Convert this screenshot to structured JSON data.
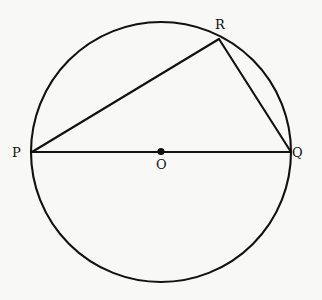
{
  "figure": {
    "background_color": "#f8f8f6",
    "stroke_color": "#111111",
    "width": 322,
    "height": 300
  },
  "circle": {
    "name": "circle-outline",
    "center_x": 161,
    "center_y": 152,
    "radius": 130,
    "stroke_width": 2.1,
    "fill": "none"
  },
  "center_point": {
    "name": "center-dot",
    "x": 161,
    "y": 151.5,
    "radius": 3.6,
    "fill": "#111111"
  },
  "points": [
    {
      "id": "P",
      "label": "P",
      "x": 32,
      "y": 152,
      "label_x": 12,
      "label_y": 146
    },
    {
      "id": "Q",
      "label": "Q",
      "x": 291,
      "y": 152,
      "label_x": 292,
      "label_y": 146
    },
    {
      "id": "R",
      "label": "R",
      "x": 219,
      "y": 39,
      "label_x": 215,
      "label_y": 18
    },
    {
      "id": "O",
      "label": "O",
      "x": 161,
      "y": 152,
      "label_x": 156,
      "label_y": 158
    }
  ],
  "segments": [
    {
      "name": "segment-PQ",
      "from": "P",
      "to": "Q",
      "x1": 32,
      "y1": 152,
      "x2": 291,
      "y2": 152,
      "stroke_width": 2.1
    },
    {
      "name": "segment-PR",
      "from": "P",
      "to": "R",
      "x1": 32,
      "y1": 152,
      "x2": 219,
      "y2": 39,
      "stroke_width": 2.1
    },
    {
      "name": "segment-RQ",
      "from": "R",
      "to": "Q",
      "x1": 219,
      "y1": 39,
      "x2": 291,
      "y2": 152,
      "stroke_width": 2.1
    }
  ],
  "labels": {
    "P": "P",
    "Q": "Q",
    "R": "R",
    "O": "O"
  }
}
